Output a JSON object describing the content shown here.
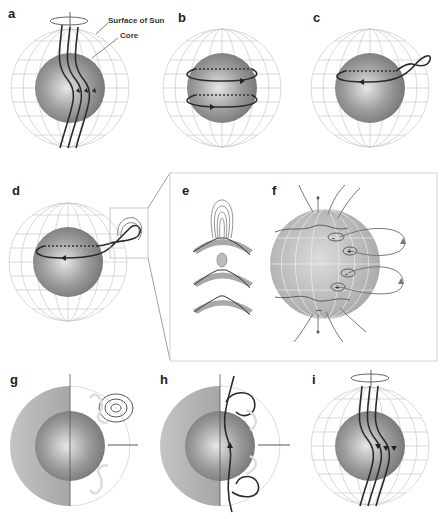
{
  "figure": {
    "panels": [
      {
        "id": "a",
        "label": "a",
        "annotations": [
          "Surface of Sun",
          "Core"
        ],
        "content": "Poloidal field lines threading sun, rotation axis ellipse on top"
      },
      {
        "id": "b",
        "label": "b",
        "content": "Two toroidal field rings wrapped around core"
      },
      {
        "id": "c",
        "label": "c",
        "content": "Toroidal ring with buoyant kink rising"
      },
      {
        "id": "d",
        "label": "d",
        "content": "Flux loop emerging through surface, boxed region"
      },
      {
        "id": "e",
        "label": "e",
        "content": "Three stages of flux emergence through surface layer"
      },
      {
        "id": "f",
        "label": "f",
        "content": "Sun with bipolar active regions and loop field lines",
        "polarity_marks": [
          "-",
          "+",
          "-",
          "+",
          "--"
        ]
      },
      {
        "id": "g",
        "label": "g",
        "content": "Meridional cut with concentric loops"
      },
      {
        "id": "h",
        "label": "h",
        "content": "Meridional cut with reconnected flux loops"
      },
      {
        "id": "i",
        "label": "i",
        "content": "Reversed poloidal field lines"
      }
    ]
  },
  "colors": {
    "core": "#8a8a8a",
    "grid": "#c8c8c8",
    "field_line": "#2a2a2a",
    "surface_band": "#a8a8a8"
  }
}
